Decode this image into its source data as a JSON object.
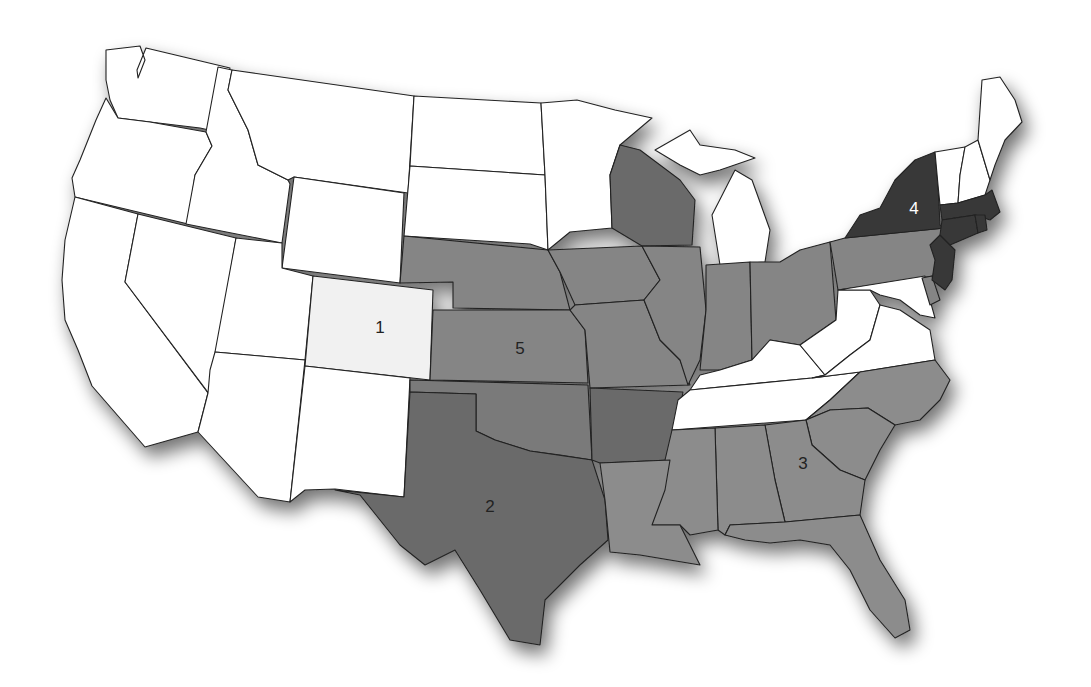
{
  "map": {
    "title": "",
    "colors": {
      "none": "#ffffff",
      "region1": "#f1f1f1",
      "region2": "#6b6b6b",
      "region3": "#8c8c8c",
      "region4": "#383838",
      "region5": "#858585",
      "border": "#222222"
    },
    "labels": [
      {
        "id": "1",
        "text": "1",
        "x": 380,
        "y": 329,
        "color": "#222222"
      },
      {
        "id": "2",
        "text": "2",
        "x": 490,
        "y": 508,
        "color": "#222222"
      },
      {
        "id": "3",
        "text": "3",
        "x": 803,
        "y": 465,
        "color": "#222222"
      },
      {
        "id": "4",
        "text": "4",
        "x": 914,
        "y": 210,
        "color": "#ffffff"
      },
      {
        "id": "5",
        "text": "5",
        "x": 520,
        "y": 350,
        "color": "#222222"
      }
    ],
    "regions": {
      "1": [
        "Colorado"
      ],
      "2": [
        "Texas",
        "Oklahoma",
        "Arkansas",
        "Wisconsin"
      ],
      "3": [
        "Louisiana",
        "Mississippi",
        "Alabama",
        "Georgia",
        "Florida",
        "South Carolina",
        "North Carolina"
      ],
      "4": [
        "New York",
        "New Jersey",
        "Connecticut",
        "Massachusetts",
        "Rhode Island"
      ],
      "5": [
        "Nebraska",
        "Kansas",
        "Iowa",
        "Missouri",
        "Illinois",
        "Indiana",
        "Ohio",
        "Pennsylvania",
        "Delaware"
      ]
    }
  }
}
